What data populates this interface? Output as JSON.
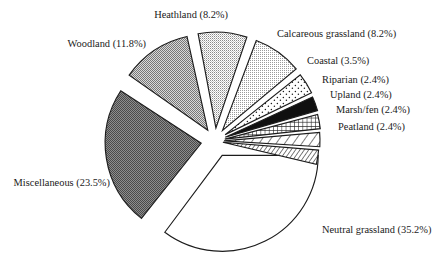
{
  "chart_data": {
    "type": "pie",
    "title": "",
    "subtitle": "",
    "xlabel": "",
    "ylabel": "",
    "legend_position": "none",
    "grid": false,
    "exploded": true,
    "units": "%",
    "categories": [
      "Neutral grassland",
      "Miscellaneous",
      "Woodland",
      "Heathland",
      "Calcareous grassland",
      "Coastal",
      "Riparian",
      "Upland",
      "Marsh/fen",
      "Peatland"
    ],
    "values": [
      35.2,
      23.5,
      11.8,
      8.2,
      8.2,
      3.5,
      2.4,
      2.4,
      2.4,
      2.4
    ],
    "slices": [
      {
        "name": "Neutral grassland",
        "value": 35.2,
        "label": "Neutral grassland (35.2%)",
        "fill": "white",
        "fill_color": "#ffffff",
        "start_deg": 0,
        "end_deg": 126.7,
        "explode": 16,
        "label_x": 322,
        "label_y": 231,
        "anchor": "start"
      },
      {
        "name": "Miscellaneous",
        "value": 23.5,
        "label": "Miscellaneous (23.5%)",
        "fill": "gray-dark",
        "fill_color": "#6e6e6e",
        "start_deg": 128.5,
        "end_deg": 213.1,
        "explode": 14,
        "label_x": 110,
        "label_y": 184,
        "anchor": "end"
      },
      {
        "name": "Woodland",
        "value": 11.8,
        "label": "Woodland (11.8%)",
        "fill": "gray-medium",
        "fill_color": "#a8a8a8",
        "start_deg": 215.0,
        "end_deg": 257.5,
        "explode": 13,
        "label_x": 146,
        "label_y": 45,
        "anchor": "end"
      },
      {
        "name": "Heathland",
        "value": 8.2,
        "label": "Heathland (8.2%)",
        "fill": "gray-light",
        "fill_color": "#c8c8c8",
        "start_deg": 259.3,
        "end_deg": 288.8,
        "explode": 13,
        "label_x": 228,
        "label_y": 16,
        "anchor": "end"
      },
      {
        "name": "Calcareous grassland",
        "value": 8.2,
        "label": "Calcareous grassland (8.2%)",
        "fill": "gray-pale",
        "fill_color": "#d4d4d4",
        "start_deg": 290.6,
        "end_deg": 320.1,
        "explode": 13,
        "label_x": 277,
        "label_y": 35,
        "anchor": "start"
      },
      {
        "name": "Coastal",
        "value": 3.5,
        "label": "Coastal (3.5%)",
        "fill": "dots",
        "fill_color": "#ffffff",
        "start_deg": 321.5,
        "end_deg": 334.1,
        "explode": 12,
        "label_x": 307,
        "label_y": 62,
        "anchor": "start"
      },
      {
        "name": "Riparian",
        "value": 2.4,
        "label": "Riparian (2.4%)",
        "fill": "solid-black",
        "fill_color": "#101010",
        "start_deg": 335.3,
        "end_deg": 343.9,
        "explode": 11,
        "label_x": 322,
        "label_y": 81,
        "anchor": "start"
      },
      {
        "name": "Upland",
        "value": 2.4,
        "label": "Upland (2.4%)",
        "fill": "crosshatch",
        "fill_color": "#ffffff",
        "start_deg": 345.1,
        "end_deg": 353.7,
        "explode": 10,
        "label_x": 330,
        "label_y": 96,
        "anchor": "start"
      },
      {
        "name": "Marsh/fen",
        "value": 2.4,
        "label": "Marsh/fen (2.4%)",
        "fill": "diagonal-wide",
        "fill_color": "#ffffff",
        "start_deg": 354.9,
        "end_deg": 363.5,
        "explode": 9,
        "label_x": 336,
        "label_y": 111,
        "anchor": "start"
      },
      {
        "name": "Peatland",
        "value": 2.4,
        "label": "Peatland (2.4%)",
        "fill": "diagonal-dense",
        "fill_color": "#ffffff",
        "start_deg": 364.7,
        "end_deg": 373.3,
        "explode": 8,
        "label_x": 338,
        "label_y": 128,
        "anchor": "start"
      }
    ],
    "geometry": {
      "center_x": 215,
      "center_y": 141,
      "radius": 96
    },
    "colors": {
      "outline": "#1c1c1c",
      "background": "#ffffff",
      "text": "#1a1a1a"
    }
  }
}
